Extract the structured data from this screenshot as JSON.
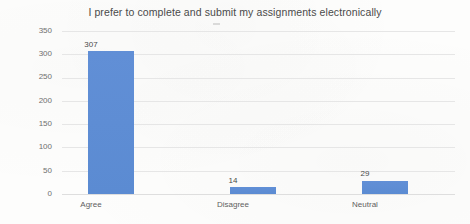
{
  "chart_data": {
    "type": "bar",
    "title": "I prefer to complete and submit my assignments electronically",
    "categories": [
      "Agree",
      "Disagree",
      "Neutral"
    ],
    "values": [
      307,
      14,
      29
    ],
    "series": [
      {
        "name": "Responses",
        "values": [
          307,
          14,
          29
        ]
      }
    ],
    "xlabel": "",
    "ylabel": "",
    "ylim": [
      0,
      350
    ],
    "yticks": [
      0,
      50,
      100,
      150,
      200,
      250,
      300,
      350
    ],
    "ytick_labels": [
      "0",
      "50",
      "100",
      "150",
      "200",
      "250",
      "300",
      "350"
    ],
    "data_labels": [
      "307",
      "14",
      "29"
    ],
    "grid": true,
    "grid_axis": "y",
    "legend": false,
    "legend_position": "none",
    "colors": {
      "bar": "#5b8ed4",
      "gridline": "#e6e6e6",
      "title_text": "#4a4a4a",
      "tick_text": "#6f6f6f",
      "background": "#fdfdfc"
    }
  }
}
